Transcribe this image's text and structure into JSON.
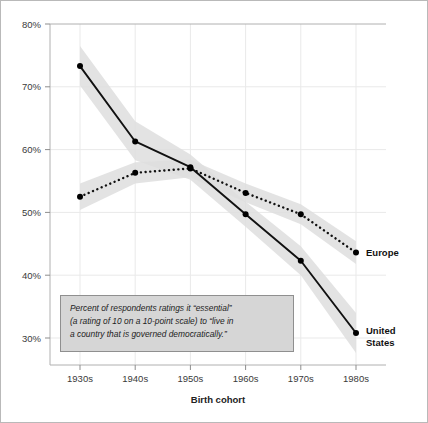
{
  "chart_data": {
    "type": "line",
    "title": "",
    "xlabel": "Birth cohort",
    "ylabel": "",
    "categories": [
      "1930s",
      "1940s",
      "1950s",
      "1960s",
      "1970s",
      "1980s"
    ],
    "ytick_labels": [
      "30%",
      "40%",
      "50%",
      "60%",
      "70%",
      "80%"
    ],
    "ytick_values": [
      30,
      40,
      50,
      60,
      70,
      80
    ],
    "ylim": [
      26,
      80
    ],
    "grid": true,
    "legend_position": "right-inline-labels",
    "series": [
      {
        "name": "United States",
        "style": "solid",
        "values": [
          73.3,
          61.3,
          57.2,
          49.7,
          42.3,
          30.8
        ],
        "band_upper": [
          76.5,
          64.5,
          59.2,
          51.7,
          44.6,
          34.0
        ],
        "band_lower": [
          70.2,
          58.3,
          55.2,
          47.7,
          40.0,
          27.6
        ]
      },
      {
        "name": "Europe",
        "style": "dotted",
        "values": [
          52.5,
          56.3,
          57.0,
          53.1,
          49.7,
          43.6
        ],
        "band_upper": [
          54.6,
          58.0,
          58.4,
          54.6,
          51.3,
          45.4
        ],
        "band_lower": [
          50.4,
          54.6,
          55.6,
          51.6,
          48.1,
          41.8
        ]
      }
    ],
    "annotation": {
      "lines": [
        "Percent of respondents ratings it “essential”",
        "(a rating of 10 on a 10-point scale) to “live in",
        "a country that is governed democratically.”"
      ]
    },
    "colors": {
      "line": "#111111",
      "band": "#dedede",
      "grid": "#e9e9e9",
      "frame": "#b9b9b9",
      "annotation_fill": "#d6d6d6",
      "annotation_border": "#8f8f8f",
      "background": "#ffffff"
    }
  },
  "series_labels": {
    "europe": "Europe",
    "united_states_line1": "United",
    "united_states_line2": "States"
  }
}
